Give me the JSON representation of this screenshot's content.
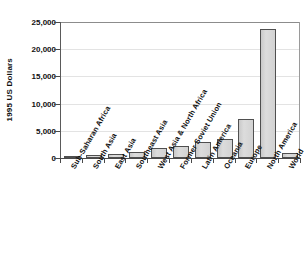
{
  "chart_data": {
    "type": "bar",
    "title": "",
    "subtitle": "",
    "xlabel": "",
    "ylabel": "1995 US Dollars",
    "ylim": [
      0,
      25000
    ],
    "yticks": [
      0,
      5000,
      10000,
      15000,
      20000,
      25000
    ],
    "ytick_labels": [
      "0",
      "5,000",
      "10,000",
      "15,000",
      "20,000",
      "25,000"
    ],
    "grid": true,
    "legend": false,
    "categories": [
      "Sub-Saharan Africa",
      "South Asia",
      "East Asia",
      "Southeast Asia",
      "West Asia & North Africa",
      "Former Soviet Union",
      "Latin America",
      "Oceania",
      "Europe",
      "North America",
      "World"
    ],
    "values": [
      400,
      500,
      800,
      1100,
      1900,
      2200,
      2900,
      3500,
      7100,
      23700,
      1000
    ],
    "bar_color": "#d4d4d4",
    "bar_edge_color": "#4f4f4f",
    "axis_color": "#4a4a4a",
    "grid_color": "#e3e3e3",
    "background_color": "#ffffff",
    "text_color": "#111111"
  }
}
